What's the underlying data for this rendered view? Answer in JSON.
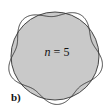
{
  "diagram": {
    "label_var": "n",
    "label_eq": " = 5",
    "panel_label": "b)",
    "n": 5,
    "circle": {
      "cx": 55,
      "cy": 56,
      "r": 44,
      "fill": "#c9c9c9",
      "stroke": "#333333"
    },
    "wave": {
      "amplitude": 4.5,
      "stroke": "#333333"
    }
  }
}
